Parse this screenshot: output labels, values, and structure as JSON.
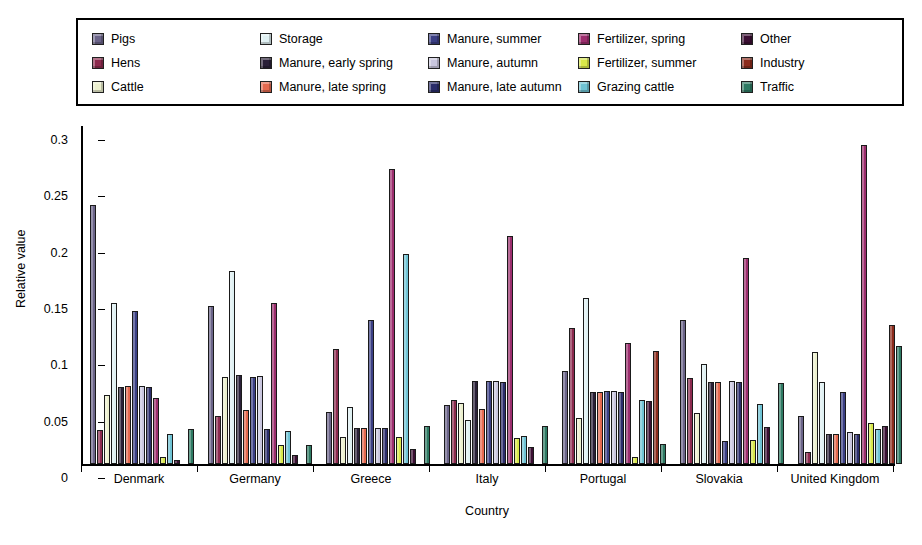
{
  "chart_data": {
    "type": "bar",
    "title": "",
    "subtitle": "",
    "xlabel": "Country",
    "ylabel": "Relative value",
    "ylim": [
      0,
      0.3
    ],
    "yticks": [
      0,
      0.05,
      0.1,
      0.15,
      0.2,
      0.25,
      0.3
    ],
    "ytick_labels": [
      "0",
      "0.05",
      "0.1",
      "0.15",
      "0.2",
      "0.25",
      "0.3"
    ],
    "grid": false,
    "legend_position": "top",
    "categories": [
      "Denmark",
      "Germany",
      "Greece",
      "Italy",
      "Portugal",
      "Slovakia",
      "United Kingdom"
    ],
    "series": [
      {
        "name": "Pigs",
        "color": "#6b6489",
        "values": [
          0.23,
          0.14,
          0.046,
          0.052,
          0.083,
          0.128,
          0.043
        ]
      },
      {
        "name": "Hens",
        "color": "#8c2a4e",
        "values": [
          0.03,
          0.043,
          0.102,
          0.057,
          0.121,
          0.076,
          0.011
        ]
      },
      {
        "name": "Cattle",
        "color": "#ecf0ce",
        "values": [
          0.061,
          0.077,
          0.024,
          0.054,
          0.041,
          0.045,
          0.099
        ]
      },
      {
        "name": "Storage",
        "color": "#dff0f2",
        "values": [
          0.143,
          0.171,
          0.051,
          0.039,
          0.147,
          0.089,
          0.073
        ]
      },
      {
        "name": "Manure, early spring",
        "color": "#2a2038",
        "values": [
          0.068,
          0.079,
          0.032,
          0.074,
          0.064,
          0.073,
          0.027
        ]
      },
      {
        "name": "Manure, late spring",
        "color": "#e5694f",
        "values": [
          0.069,
          0.048,
          0.032,
          0.049,
          0.064,
          0.073,
          0.027
        ]
      },
      {
        "name": "Manure, summer",
        "color": "#3b3f84",
        "values": [
          0.136,
          0.077,
          0.128,
          0.074,
          0.065,
          0.02,
          0.064
        ]
      },
      {
        "name": "Manure, autumn",
        "color": "#c9c6de",
        "values": [
          0.069,
          0.078,
          0.032,
          0.074,
          0.065,
          0.074,
          0.028
        ]
      },
      {
        "name": "Manure, late autumn",
        "color": "#2b2d6b",
        "values": [
          0.068,
          0.031,
          0.032,
          0.073,
          0.064,
          0.073,
          0.027
        ]
      },
      {
        "name": "Fertilizer, spring",
        "color": "#9c2e6e",
        "values": [
          0.059,
          0.143,
          0.262,
          0.202,
          0.107,
          0.183,
          0.283
        ]
      },
      {
        "name": "Fertilizer, summer",
        "color": "#d9e84a",
        "values": [
          0.006,
          0.017,
          0.024,
          0.023,
          0.006,
          0.021,
          0.036
        ]
      },
      {
        "name": "Grazing cattle",
        "color": "#6fc3d4",
        "values": [
          0.027,
          0.029,
          0.186,
          0.025,
          0.057,
          0.053,
          0.031
        ]
      },
      {
        "name": "Other",
        "color": "#3b0f33",
        "values": [
          0.004,
          0.008,
          0.013,
          0.015,
          0.056,
          0.033,
          0.034
        ]
      },
      {
        "name": "Industry",
        "color": "#8c2b1c",
        "values": [
          0.0,
          0.0,
          0.0,
          0.0,
          0.1,
          0.0,
          0.123
        ]
      },
      {
        "name": "Traffic",
        "color": "#2e7a63",
        "values": [
          0.031,
          0.017,
          0.034,
          0.034,
          0.018,
          0.072,
          0.105
        ]
      }
    ]
  },
  "legend": {
    "items": [
      {
        "label": "Pigs",
        "color": "#6b6489"
      },
      {
        "label": "Hens",
        "color": "#8c2a4e"
      },
      {
        "label": "Cattle",
        "color": "#ecf0ce"
      },
      {
        "label": "Storage",
        "color": "#dff0f2"
      },
      {
        "label": "Manure, early spring",
        "color": "#2a2038"
      },
      {
        "label": "Manure, late spring",
        "color": "#e5694f"
      },
      {
        "label": "Manure, summer",
        "color": "#3b3f84"
      },
      {
        "label": "Manure, autumn",
        "color": "#c9c6de"
      },
      {
        "label": "Manure, late autumn",
        "color": "#2b2d6b"
      },
      {
        "label": "Fertilizer, spring",
        "color": "#9c2e6e"
      },
      {
        "label": "Fertilizer, summer",
        "color": "#d9e84a"
      },
      {
        "label": "Grazing cattle",
        "color": "#6fc3d4"
      },
      {
        "label": "Other",
        "color": "#3b0f33"
      },
      {
        "label": "Industry",
        "color": "#8c2b1c"
      },
      {
        "label": "Traffic",
        "color": "#2e7a63"
      }
    ]
  }
}
